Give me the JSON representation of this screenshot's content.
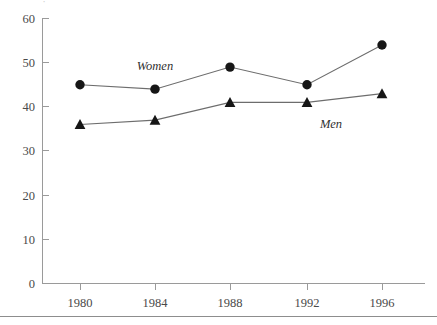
{
  "chart_data": {
    "type": "line",
    "title": "",
    "subtitle": "",
    "xlabel": "",
    "ylabel": "",
    "categories": [
      "1980",
      "1984",
      "1988",
      "1992",
      "1996"
    ],
    "x": [
      1980,
      1984,
      1988,
      1992,
      1996
    ],
    "series": [
      {
        "name": "Women",
        "marker": "circle",
        "values": [
          45,
          44,
          49,
          45,
          54
        ]
      },
      {
        "name": "Men",
        "marker": "triangle",
        "values": [
          36,
          37,
          41,
          41,
          43
        ]
      }
    ],
    "ylim": [
      0,
      60
    ],
    "ytick_labels": [
      "0",
      "10",
      "20",
      "30",
      "40",
      "50",
      "60"
    ],
    "yticks": [
      0,
      10,
      20,
      30,
      40,
      50,
      60
    ],
    "xtick_labels": [
      "1980",
      "1984",
      "1988",
      "1992",
      "1996"
    ],
    "grid": false,
    "legend_position": "inline-annotations",
    "annotations": [
      {
        "text": "Women",
        "x": 1983.6,
        "y": 51.5
      },
      {
        "text": "Men",
        "x": 1991.2,
        "y": 38.2
      }
    ],
    "line_color": "#6d6d6d",
    "marker_color": "#161616",
    "axis_color": "#9a9a9a"
  },
  "axes": {
    "y_labels": [
      "60",
      "50",
      "40",
      "30",
      "20",
      "10",
      "0"
    ],
    "x_labels": [
      "1980",
      "1984",
      "1988",
      "1992",
      "1996"
    ]
  },
  "series_labels": {
    "women": "Women",
    "men": "Men"
  },
  "decor": {
    "clipped_glyph": "·"
  }
}
